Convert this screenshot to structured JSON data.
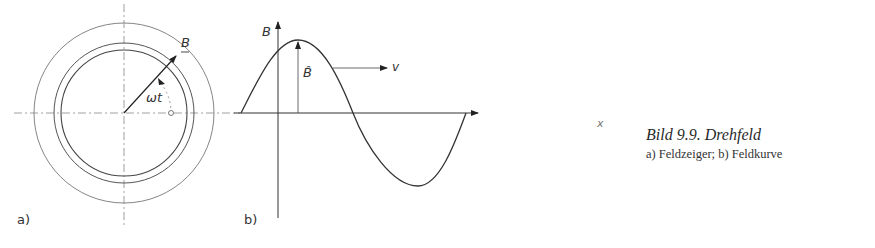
{
  "figure": {
    "panel_a": {
      "label": "a)",
      "vector_label": "B",
      "angle_label": "ωt",
      "center": [
        124,
        113
      ],
      "radii": [
        63,
        70,
        90
      ]
    },
    "panel_b": {
      "label": "b)",
      "y_axis_label": "B",
      "x_axis_label": "x",
      "amplitude_label": "B̂",
      "velocity_label": "v"
    },
    "caption": {
      "title": "Bild 9.9. Drehfeld",
      "subtitle": "a) Feldzeiger; b) Feldkurve"
    },
    "colors": {
      "line": "#333333",
      "guide": "#888888"
    }
  }
}
